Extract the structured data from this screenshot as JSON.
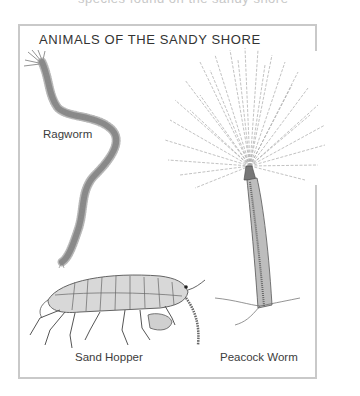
{
  "page": {
    "cut_off_caption": "species found on the sandy shore",
    "figure": {
      "title": "ANIMALS OF THE SANDY SHORE",
      "illustrations": [
        {
          "id": "ragworm",
          "label": "Ragworm"
        },
        {
          "id": "sand-hopper",
          "label": "Sand Hopper"
        },
        {
          "id": "peacock-worm",
          "label": "Peacock Worm"
        }
      ]
    }
  },
  "colors": {
    "border": "#c9c9c9",
    "text": "#333333",
    "ink": "#555555"
  }
}
